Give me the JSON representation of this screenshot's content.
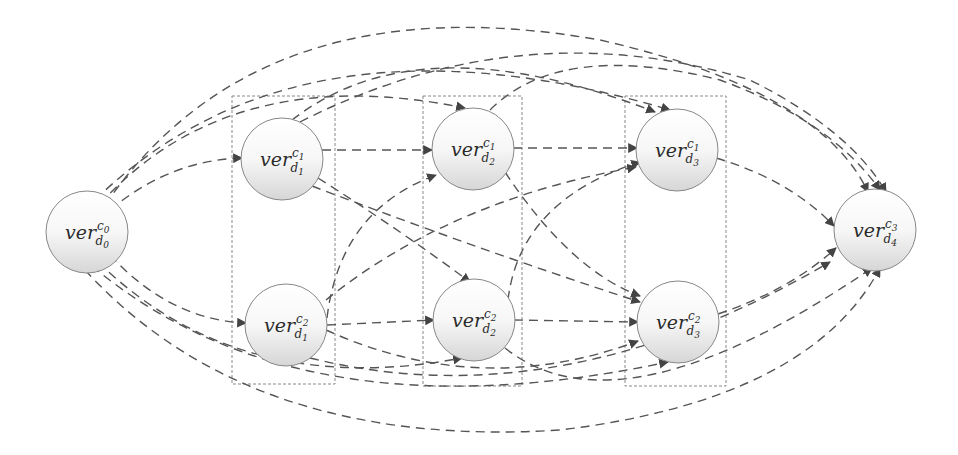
{
  "diagram": {
    "type": "directed-graph",
    "colors": {
      "edge": "#555555",
      "arrow": "#444444",
      "node_fill_top": "#ffffff",
      "node_fill_bottom": "#dcdcdc",
      "node_stroke": "#888888",
      "group_stroke": "#888888",
      "text": "#2b2b2b"
    },
    "nodes": [
      {
        "id": "d0c0",
        "base": "ver",
        "sup": "c",
        "sup_idx": "0",
        "sub": "d",
        "sub_idx": "0",
        "x": 87,
        "y": 232
      },
      {
        "id": "d1c1",
        "base": "ver",
        "sup": "c",
        "sup_idx": "1",
        "sub": "d",
        "sub_idx": "1",
        "x": 282,
        "y": 159
      },
      {
        "id": "d1c2",
        "base": "ver",
        "sup": "c",
        "sup_idx": "2",
        "sub": "d",
        "sub_idx": "1",
        "x": 286,
        "y": 325
      },
      {
        "id": "d2c1",
        "base": "ver",
        "sup": "c",
        "sup_idx": "1",
        "sub": "d",
        "sub_idx": "2",
        "x": 473,
        "y": 149
      },
      {
        "id": "d2c2",
        "base": "ver",
        "sup": "c",
        "sup_idx": "2",
        "sub": "d",
        "sub_idx": "2",
        "x": 474,
        "y": 320
      },
      {
        "id": "d3c1",
        "base": "ver",
        "sup": "c",
        "sup_idx": "1",
        "sub": "d",
        "sub_idx": "3",
        "x": 677,
        "y": 150
      },
      {
        "id": "d3c2",
        "base": "ver",
        "sup": "c",
        "sup_idx": "2",
        "sub": "d",
        "sub_idx": "3",
        "x": 678,
        "y": 322
      },
      {
        "id": "d4c3",
        "base": "ver",
        "sup": "c",
        "sup_idx": "3",
        "sub": "d",
        "sub_idx": "4",
        "x": 875,
        "y": 230
      }
    ],
    "groups": [
      {
        "id": "stage-d1",
        "x": 232,
        "y": 96,
        "w": 103,
        "h": 288
      },
      {
        "id": "stage-d2",
        "x": 423,
        "y": 96,
        "w": 99,
        "h": 290
      },
      {
        "id": "stage-d3",
        "x": 625,
        "y": 96,
        "w": 101,
        "h": 290
      }
    ],
    "edges": [
      {
        "from": "d0c0",
        "to": "d1c1",
        "style": "dashed"
      },
      {
        "from": "d0c0",
        "to": "d1c2",
        "style": "dashed"
      },
      {
        "from": "d0c0",
        "to": "d2c1",
        "style": "dashed"
      },
      {
        "from": "d0c0",
        "to": "d2c2",
        "style": "dashed"
      },
      {
        "from": "d0c0",
        "to": "d3c1",
        "style": "dashed"
      },
      {
        "from": "d0c0",
        "to": "d3c2",
        "style": "dashed"
      },
      {
        "from": "d0c0",
        "to": "d4c3",
        "style": "dashed"
      },
      {
        "from": "d1c1",
        "to": "d2c1",
        "style": "dashed"
      },
      {
        "from": "d1c1",
        "to": "d2c2",
        "style": "dashed"
      },
      {
        "from": "d1c1",
        "to": "d3c1",
        "style": "dashed"
      },
      {
        "from": "d1c1",
        "to": "d3c2",
        "style": "dashed"
      },
      {
        "from": "d1c1",
        "to": "d4c3",
        "style": "dashed"
      },
      {
        "from": "d1c2",
        "to": "d2c1",
        "style": "dashed"
      },
      {
        "from": "d1c2",
        "to": "d2c2",
        "style": "dashed"
      },
      {
        "from": "d1c2",
        "to": "d3c1",
        "style": "dashed"
      },
      {
        "from": "d1c2",
        "to": "d3c2",
        "style": "dashed"
      },
      {
        "from": "d1c2",
        "to": "d4c3",
        "style": "dashed"
      },
      {
        "from": "d2c1",
        "to": "d3c1",
        "style": "dashed"
      },
      {
        "from": "d2c1",
        "to": "d3c2",
        "style": "dashed"
      },
      {
        "from": "d2c1",
        "to": "d4c3",
        "style": "dashed"
      },
      {
        "from": "d2c2",
        "to": "d3c1",
        "style": "dashed"
      },
      {
        "from": "d2c2",
        "to": "d3c2",
        "style": "dashed"
      },
      {
        "from": "d2c2",
        "to": "d4c3",
        "style": "dashed"
      },
      {
        "from": "d3c1",
        "to": "d4c3",
        "style": "dashed"
      },
      {
        "from": "d3c2",
        "to": "d4c3",
        "style": "dashed"
      }
    ]
  }
}
